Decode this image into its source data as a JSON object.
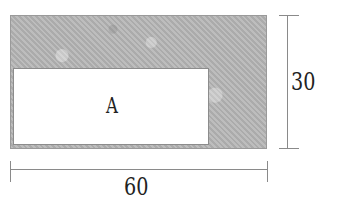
{
  "diagram": {
    "outer_rect": {
      "fill": "#b4b4b4",
      "texture": "mottled-gray"
    },
    "inner_rect": {
      "label": "A",
      "fill": "#ffffff"
    },
    "dimensions": {
      "height": "30",
      "width": "60"
    }
  }
}
